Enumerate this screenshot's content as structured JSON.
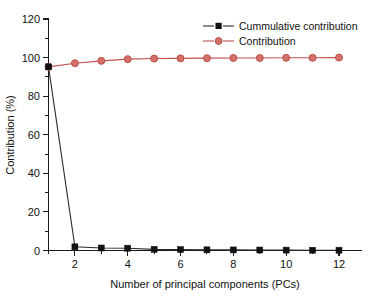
{
  "chart_data": {
    "type": "line",
    "title": "",
    "subtitle": "",
    "xlabel": "Number of principal components (PCs)",
    "ylabel": "Contribution (%)",
    "xlim": [
      0.5,
      12.8
    ],
    "ylim": [
      0,
      120
    ],
    "x": [
      1,
      2,
      3,
      4,
      5,
      6,
      7,
      8,
      9,
      10,
      11,
      12
    ],
    "xticks": [
      2,
      4,
      6,
      8,
      10,
      12
    ],
    "xtick_labels": [
      "2",
      "4",
      "6",
      "8",
      "10",
      "12"
    ],
    "xminor_ticks": [
      1,
      3,
      5,
      7,
      9,
      11
    ],
    "yticks": [
      0,
      20,
      40,
      60,
      80,
      100,
      120
    ],
    "ytick_labels": [
      "0",
      "20",
      "40",
      "60",
      "80",
      "100",
      "120"
    ],
    "yminor_ticks": [
      10,
      30,
      50,
      70,
      90,
      110
    ],
    "grid": false,
    "legend_position": "top-right",
    "series": [
      {
        "name": "Cummulative contribution",
        "color": "#1a1a1a",
        "marker": "square",
        "values": [
          95.2,
          1.9,
          1.3,
          1.2,
          0.6,
          0.45,
          0.35,
          0.3,
          0.25,
          0.2,
          0.15,
          0.15
        ]
      },
      {
        "name": "Contribution",
        "color": "#c0504d",
        "marker": "circle",
        "values": [
          95.2,
          97.1,
          98.3,
          99.2,
          99.5,
          99.6,
          99.7,
          99.8,
          99.8,
          99.9,
          99.9,
          100.0
        ]
      }
    ]
  },
  "legend": {
    "entries": [
      {
        "label": "Cummulative contribution",
        "marker": "square-marker",
        "color": "#1a1a1a"
      },
      {
        "label": "Contribution",
        "marker": "circle-marker",
        "color": "#c0504d"
      }
    ]
  },
  "axes": {
    "x_title": "Number of principal components (PCs)",
    "y_title": "Contribution (%)"
  },
  "colors": {
    "background": "#ffffff",
    "axis": "#1a1a1a",
    "series_black": "#1a1a1a",
    "series_red": "#c0504d",
    "marker_red_fill": "#d4706a"
  }
}
